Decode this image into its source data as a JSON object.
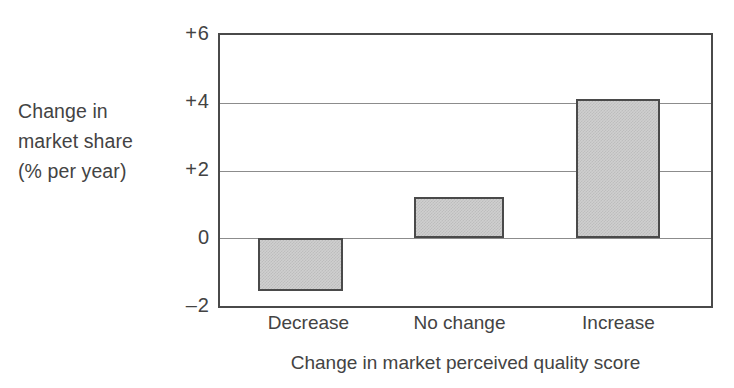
{
  "chart_data": {
    "type": "bar",
    "title": "",
    "categories": [
      "Decrease",
      "No change",
      "Increase"
    ],
    "values": [
      -1.55,
      1.22,
      4.1
    ],
    "series": [
      {
        "name": "Change in market share (% per year)",
        "values": [
          -1.55,
          1.22,
          4.1
        ]
      }
    ],
    "xlabel": "Change in market perceived quality score",
    "ylabel": "Change in market share (% per year)",
    "ylabel_lines": [
      "Change in",
      "market share",
      "(% per year)"
    ],
    "ylim": [
      -2,
      6
    ],
    "ytick_values": [
      6,
      4,
      2,
      0,
      -2
    ],
    "ytick_labels": [
      "+6",
      "+4",
      "+2",
      "0",
      "–2"
    ],
    "grid": true,
    "grid_axis": "y",
    "legend": null,
    "legend_position": "none",
    "bar_fill_color": "#cfcfcf",
    "bar_edge_color": "#4a4a4a",
    "axis_color": "#4a4a4a",
    "gridline_color": "#8c8c8c",
    "text_color": "#434343",
    "background_color": "#ffffff"
  },
  "axis": {
    "y_caption_line1": "Change in",
    "y_caption_line2": "market share",
    "y_caption_line3": "(% per year)",
    "x_title": "Change in market perceived quality score"
  },
  "ticks": {
    "y": [
      {
        "label": "+6",
        "value": 6
      },
      {
        "label": "+4",
        "value": 4
      },
      {
        "label": "+2",
        "value": 2
      },
      {
        "label": "0",
        "value": 0
      },
      {
        "label": "–2",
        "value": -2
      }
    ],
    "x": [
      {
        "label": "Decrease"
      },
      {
        "label": "No change"
      },
      {
        "label": "Increase"
      }
    ]
  }
}
